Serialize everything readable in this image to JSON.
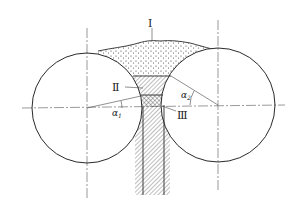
{
  "diagram": {
    "type": "roll-compaction-zones",
    "labels": {
      "zone1": "Ⅰ",
      "zone2": "Ⅱ",
      "zone3": "Ⅲ",
      "alpha1": "α",
      "alpha1_sub": "1",
      "alpha2": "α",
      "alpha2_sub": "2"
    },
    "colors": {
      "stroke": "#2a2a2a",
      "centerline": "#555555",
      "background": "#ffffff"
    }
  }
}
